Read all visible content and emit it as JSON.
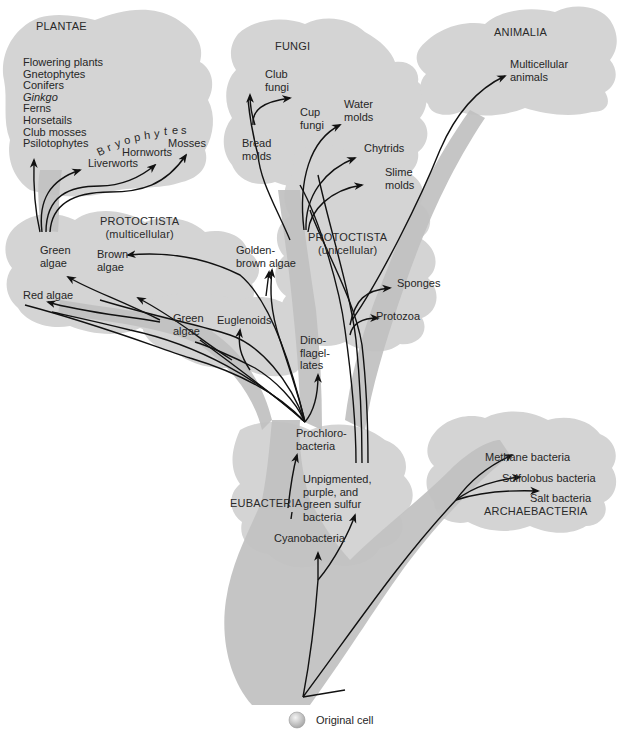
{
  "diagram": {
    "type": "phylogenetic-tree",
    "root": "Original cell",
    "colors": {
      "background": "#ffffff",
      "region_light": "#d4d4d4",
      "trunk_dark": "#bdbdbd",
      "arrow": "#111111",
      "text": "#262626"
    }
  },
  "kingdoms": {
    "plantae": "PLANTAE",
    "fungi": "FUNGI",
    "animalia": "ANIMALIA",
    "protoctista_multi_1": "PROTOCTISTA",
    "protoctista_multi_2": "(multicellular)",
    "protoctista_uni_1": "PROTOCTISTA",
    "protoctista_uni_2": "(unicellular)",
    "eubacteria": "EUBACTERIA",
    "archaebacteria": "ARCHAEBACTERIA"
  },
  "plantae": {
    "list": [
      "Flowering plants",
      "Gnetophytes",
      "Conifers",
      "Ginkgo",
      "Ferns",
      "Horsetails",
      "Club mosses",
      "Psilotophytes"
    ],
    "bryophytes_title": [
      "B",
      "r",
      "y",
      "o",
      "p",
      "h",
      "y",
      "t",
      "e",
      "s"
    ],
    "liverworts": "Liverworts",
    "hornworts": "Hornworts",
    "mosses": "Mosses"
  },
  "fungi": {
    "club_1": "Club",
    "club_2": "fungi",
    "cup_1": "Cup",
    "cup_2": "fungi",
    "bread_1": "Bread",
    "bread_2": "molds"
  },
  "protoctista_uni": {
    "water_1": "Water",
    "water_2": "molds",
    "chytrids": "Chytrids",
    "slime_1": "Slime",
    "slime_2": "molds"
  },
  "animalia": {
    "multi_1": "Multicellular",
    "multi_2": "animals",
    "sponges": "Sponges",
    "protozoa": "Protozoa"
  },
  "protoctista_multi": {
    "green_algae_1": "Green",
    "green_algae_2": "algae",
    "brown_1": "Brown",
    "brown_2": "algae",
    "red_algae": "Red algae",
    "golden_1": "Golden-",
    "golden_2": "brown algae",
    "green2_1": "Green",
    "green2_2": "algae",
    "euglenoids": "Euglenoids",
    "dino_1": "Dino-",
    "dino_2": "flagel-",
    "dino_3": "lates"
  },
  "eubacteria": {
    "prochloro_1": "Prochloro-",
    "prochloro_2": "bacteria",
    "unpig_1": "Unpigmented,",
    "unpig_2": "purple, and",
    "unpig_3": "green sulfur",
    "unpig_4": "bacteria",
    "cyano": "Cyanobacteria"
  },
  "archaebacteria": {
    "methane": "Methane bacteria",
    "sulfolobus": "Sulfolobus bacteria",
    "salt": "Salt bacteria"
  },
  "legend": {
    "original_cell": "Original cell"
  }
}
